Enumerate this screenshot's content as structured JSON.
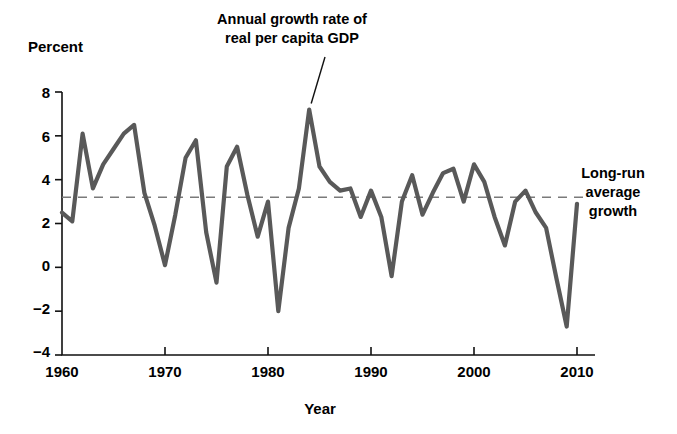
{
  "chart_data": {
    "type": "line",
    "title": "",
    "xlabel": "Year",
    "ylabel": "Percent",
    "xlim": [
      1960,
      2010
    ],
    "ylim": [
      -4,
      8
    ],
    "xticks": [
      1960,
      1970,
      1980,
      1990,
      2000,
      2010
    ],
    "yticks": [
      8,
      6,
      4,
      2,
      0,
      -2,
      -4
    ],
    "grid": false,
    "legend_position": "none",
    "series": [
      {
        "name": "Annual growth rate of real per capita GDP",
        "color": "#595959",
        "x": [
          1960,
          1961,
          1962,
          1963,
          1964,
          1965,
          1966,
          1967,
          1968,
          1969,
          1970,
          1971,
          1972,
          1973,
          1974,
          1975,
          1976,
          1977,
          1978,
          1979,
          1980,
          1981,
          1982,
          1983,
          1984,
          1985,
          1986,
          1987,
          1988,
          1989,
          1990,
          1991,
          1992,
          1993,
          1994,
          1995,
          1996,
          1997,
          1998,
          1999,
          2000,
          2001,
          2002,
          2003,
          2004,
          2005,
          2006,
          2007,
          2008,
          2009,
          2010
        ],
        "values": [
          2.5,
          2.1,
          6.1,
          3.6,
          4.7,
          5.4,
          6.1,
          6.5,
          3.4,
          1.9,
          0.1,
          2.4,
          5.0,
          5.8,
          1.6,
          -0.7,
          4.6,
          5.5,
          3.3,
          1.4,
          3.0,
          -2.0,
          1.8,
          3.6,
          7.2,
          4.6,
          3.9,
          3.5,
          3.6,
          2.3,
          3.5,
          2.3,
          -0.4,
          3.0,
          4.2,
          2.4,
          3.4,
          4.3,
          4.5,
          3.0,
          4.7,
          3.9,
          2.3,
          1.0,
          3.0,
          3.5,
          2.5,
          1.8,
          -0.5,
          -2.7,
          2.9
        ]
      }
    ],
    "reference_line": {
      "label": "Long-run average growth",
      "value": 3.2,
      "color": "#7a7a7a",
      "style": "dashed"
    },
    "annotations": [
      {
        "label_line1": "Annual growth rate of",
        "label_line2": "real per capita GDP",
        "points_to_year": 1984,
        "points_to_value": 7.2
      },
      {
        "label_line1": "Long-run",
        "label_line2": "average",
        "label_line3": "growth",
        "points_to_value": 3.2
      }
    ]
  },
  "labels": {
    "y_axis_title": "Percent",
    "x_axis_title": "Year",
    "annotation_series_line1": "Annual growth rate of",
    "annotation_series_line2": "real per capita GDP",
    "annotation_avg_line1": "Long-run",
    "annotation_avg_line2": "average",
    "annotation_avg_line3": "growth",
    "ytick_8": "8",
    "ytick_6": "6",
    "ytick_4": "4",
    "ytick_2": "2",
    "ytick_0": "0",
    "ytick_m2": "−2",
    "ytick_m4": "−4",
    "xtick_1960": "1960",
    "xtick_1970": "1970",
    "xtick_1980": "1980",
    "xtick_1990": "1990",
    "xtick_2000": "2000",
    "xtick_2010": "2010"
  },
  "colors": {
    "series": "#595959",
    "reference": "#7a7a7a",
    "axis": "#111111",
    "text": "#000000",
    "background": "#ffffff"
  }
}
